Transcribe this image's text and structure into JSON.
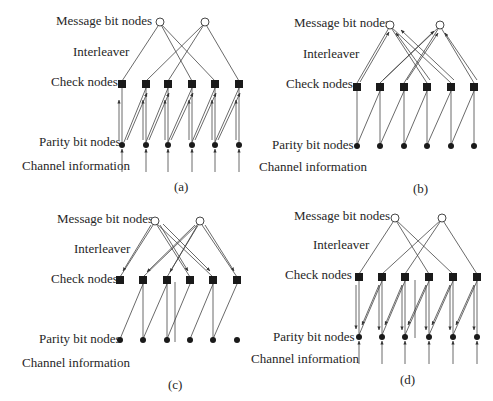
{
  "figure": {
    "panels": [
      {
        "id": "a",
        "caption": "(a)",
        "labels": {
          "message": "Message bit nodes",
          "interleaver": "Interleaver",
          "check": "Check nodes",
          "parity": "Parity bit nodes",
          "channel": "Channel information"
        },
        "description": "Parity bit nodes receive channel information and send messages up to check nodes"
      },
      {
        "id": "b",
        "caption": "(b)",
        "labels": {
          "message": "Message bit nodes",
          "interleaver": "Interleaver",
          "check": "Check nodes",
          "parity": "Parity bit nodes",
          "channel": "Channel information"
        },
        "description": "Check nodes send messages up through the interleaver to message bit nodes"
      },
      {
        "id": "c",
        "caption": "(c)",
        "labels": {
          "message": "Message bit nodes",
          "interleaver": "Interleaver",
          "check": "Check nodes",
          "parity": "Parity bit nodes",
          "channel": "Channel information"
        },
        "description": "Message bit nodes send messages down through the interleaver to check nodes"
      },
      {
        "id": "d",
        "caption": "(d)",
        "labels": {
          "message": "Message bit nodes",
          "interleaver": "Interleaver",
          "check": "Check nodes",
          "parity": "Parity bit nodes",
          "channel": "Channel information"
        },
        "description": "Check nodes send messages down to parity bit nodes, which also receive channel information"
      }
    ],
    "node_counts": {
      "message_bit_nodes": 2,
      "check_nodes": 6,
      "parity_bit_nodes": 6
    },
    "colors": {
      "line": "#333333",
      "node_fill": "#1a1a1a",
      "message_node_fill": "#ffffff"
    }
  }
}
